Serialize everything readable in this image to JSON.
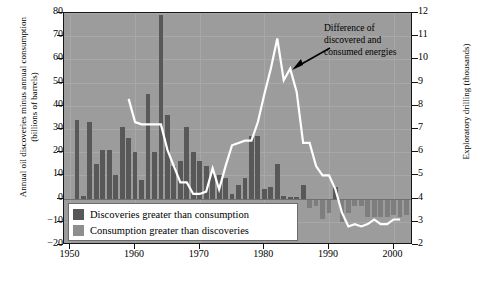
{
  "chart_data": {
    "type": "bar",
    "title": "",
    "subtitle": "",
    "ylabel_left": "Annual oil discoveries minus annual consumption (billions of barrels)",
    "ylabel_right": "Exploratory drilling (thousands)",
    "xlabel": "",
    "xlim": [
      1949,
      2003
    ],
    "ylim_left": [
      -20,
      80
    ],
    "ylim_right": [
      2,
      12
    ],
    "yticks_left": [
      -20,
      -10,
      0,
      10,
      20,
      30,
      40,
      50,
      60,
      70,
      80
    ],
    "yticks_right": [
      2,
      3,
      4,
      5,
      6,
      7,
      8,
      9,
      10,
      11,
      12
    ],
    "xticks": [
      1950,
      1960,
      1970,
      1980,
      1990,
      2000
    ],
    "grid": true,
    "legend_position": "inside-bottom-left",
    "annotations": [
      {
        "text": "Difference of discovered and consumed energies",
        "points_to_year": 1982,
        "points_to_value_right": 10.9
      }
    ],
    "series": [
      {
        "name": "Discoveries greater than consumption",
        "type": "bar",
        "axis": "left",
        "color": "#585858",
        "x": [
          1951,
          1952,
          1953,
          1954,
          1955,
          1956,
          1957,
          1958,
          1959,
          1960,
          1961,
          1962,
          1963,
          1964,
          1965,
          1966,
          1967,
          1968,
          1969,
          1970,
          1971,
          1972,
          1973,
          1974,
          1975,
          1976,
          1977,
          1978,
          1979,
          1980,
          1981,
          1982,
          1983,
          1984,
          1985,
          1986,
          1991
        ],
        "values": [
          34,
          1,
          33,
          15,
          21,
          21,
          10,
          31,
          26,
          20,
          8,
          45,
          20,
          79,
          36,
          14,
          16,
          31,
          20,
          16,
          14,
          11,
          10,
          9,
          2,
          6,
          9,
          27,
          27,
          4,
          5,
          15,
          1,
          0.5,
          0.5,
          6,
          5
        ]
      },
      {
        "name": "Consumption greater than discoveries",
        "type": "bar",
        "axis": "left",
        "color": "#7e7e7e",
        "x": [
          1987,
          1988,
          1989,
          1990,
          1992,
          1993,
          1994,
          1995,
          1996,
          1997,
          1998,
          1999,
          2000,
          2001,
          2002
        ],
        "values": [
          -4,
          -3,
          -9,
          -6,
          -10,
          -6,
          -3,
          -3,
          -8,
          -8,
          -8,
          -8,
          -7,
          -8,
          -7
        ]
      },
      {
        "name": "Exploratory drilling",
        "type": "line",
        "axis": "right",
        "color": "#ffffff",
        "x": [
          1959,
          1960,
          1961,
          1962,
          1963,
          1964,
          1965,
          1966,
          1967,
          1968,
          1969,
          1970,
          1971,
          1972,
          1973,
          1974,
          1975,
          1976,
          1977,
          1978,
          1979,
          1980,
          1981,
          1982,
          1983,
          1984,
          1985,
          1986,
          1987,
          1988,
          1989,
          1990,
          1991,
          1992,
          1993,
          1994,
          1995,
          1996,
          1997,
          1998,
          1999,
          2000,
          2001
        ],
        "values": [
          8.3,
          7.3,
          7.2,
          7.2,
          7.2,
          7.2,
          6.1,
          5.4,
          4.7,
          4.7,
          4.2,
          4.2,
          4.3,
          5.3,
          4.4,
          5.4,
          6.3,
          6.4,
          6.5,
          6.5,
          7.3,
          8.5,
          9.6,
          10.9,
          9.1,
          9.6,
          8.6,
          6.4,
          6.4,
          5.4,
          5.0,
          5.0,
          4.4,
          3.4,
          2.8,
          2.9,
          2.8,
          2.9,
          3.1,
          2.9,
          2.9,
          3.1,
          3.1
        ]
      }
    ]
  },
  "legend": {
    "items": [
      {
        "label": "Discoveries greater than consumption",
        "color": "#585858"
      },
      {
        "label": "Consumption greater than discoveries",
        "color": "#8e8e8e"
      }
    ]
  },
  "annotation": {
    "line1": "Difference of",
    "line2": "discovered and",
    "line3": "consumed energies"
  },
  "axes": {
    "left_title": "Annual oil discoveries minus annual consumption (billions of barrels)",
    "right_title": "Exploratory drilling (thousands)",
    "yticks_left": [
      "80",
      "70",
      "60",
      "50",
      "40",
      "30",
      "20",
      "10",
      "0",
      "−10",
      "−20"
    ],
    "yticks_right": [
      "12",
      "11",
      "10",
      "9",
      "8",
      "7",
      "6",
      "5",
      "4",
      "3",
      "2"
    ],
    "xticks": [
      "1950",
      "1960",
      "1970",
      "1980",
      "1990",
      "2000"
    ]
  }
}
